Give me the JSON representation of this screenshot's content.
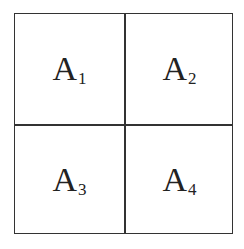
{
  "diagram": {
    "type": "2x2 grid",
    "cells": [
      {
        "label": "A",
        "subscript": "1",
        "position": "top-left"
      },
      {
        "label": "A",
        "subscript": "2",
        "position": "top-right"
      },
      {
        "label": "A",
        "subscript": "3",
        "position": "bottom-left"
      },
      {
        "label": "A",
        "subscript": "4",
        "position": "bottom-right"
      }
    ]
  }
}
